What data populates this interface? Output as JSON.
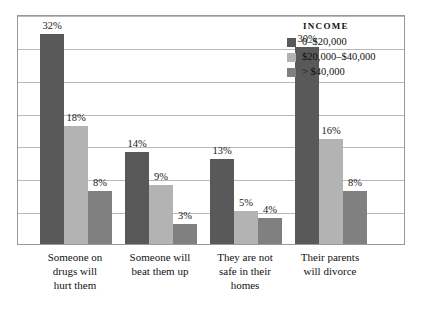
{
  "chart_data": {
    "type": "bar",
    "title": "",
    "xlabel": "",
    "ylabel": "",
    "ylim": [
      0,
      35
    ],
    "grid": true,
    "gridline_count": 7,
    "legend_position": "top-right",
    "legend_title": "INCOME",
    "categories": [
      "Someone on drugs will hurt them",
      "Someone will beat them up",
      "They are not safe in their homes",
      "Their parents will divorce"
    ],
    "series": [
      {
        "name": "0–$20,000",
        "color": "#595959",
        "values": [
          32,
          14,
          13,
          30
        ],
        "labels": [
          "32%",
          "14%",
          "13%",
          "30%"
        ]
      },
      {
        "name": "$20,000–$40,000",
        "color": "#b3b3b3",
        "values": [
          18,
          9,
          5,
          16
        ],
        "labels": [
          "18%",
          "9%",
          "5%",
          "16%"
        ]
      },
      {
        "name": "> $40,000",
        "color": "#808080",
        "values": [
          8,
          3,
          4,
          8
        ],
        "labels": [
          "8%",
          "3%",
          "4%",
          "8%"
        ]
      }
    ]
  },
  "legend": {
    "title": "INCOME",
    "entries": [
      {
        "label": "0–$20,000",
        "color": "#595959"
      },
      {
        "label": "$20,000–$40,000",
        "color": "#b3b3b3"
      },
      {
        "label": "> $40,000",
        "color": "#808080"
      }
    ]
  },
  "categories": [
    {
      "line1": "Someone on",
      "line2": "drugs will",
      "line3": "hurt them"
    },
    {
      "line1": "Someone will",
      "line2": "beat them up",
      "line3": ""
    },
    {
      "line1": "They are not",
      "line2": "safe in their",
      "line3": "homes"
    },
    {
      "line1": "Their parents",
      "line2": "will divorce",
      "line3": ""
    }
  ]
}
